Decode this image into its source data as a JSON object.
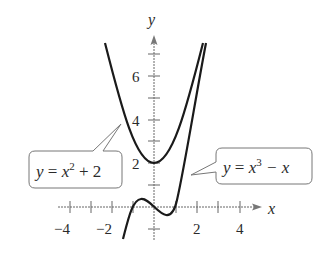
{
  "axes": {
    "x_label": "x",
    "y_label": "y",
    "x_ticks": [
      {
        "value": -4,
        "label": "−4"
      },
      {
        "value": -2,
        "label": "−2"
      },
      {
        "value": 2,
        "label": "2"
      },
      {
        "value": 4,
        "label": "4"
      }
    ],
    "y_ticks": [
      {
        "value": 2,
        "label": "2"
      },
      {
        "value": 4,
        "label": "4"
      },
      {
        "value": 6,
        "label": "6"
      }
    ]
  },
  "curves": [
    {
      "name": "parabola",
      "equation": "y = x^2 + 2",
      "label_y": "y",
      "label_eq": " = ",
      "label_x": "x",
      "label_exp": "2",
      "label_rest": " + 2"
    },
    {
      "name": "cubic",
      "equation": "y = x^3 - x",
      "label_y": "y",
      "label_eq": " = ",
      "label_x": "x",
      "label_exp": "3",
      "label_rest": " − x"
    }
  ],
  "colors": {
    "curve": "#1a1a1a",
    "axis": "#555555",
    "box": "#666666"
  }
}
